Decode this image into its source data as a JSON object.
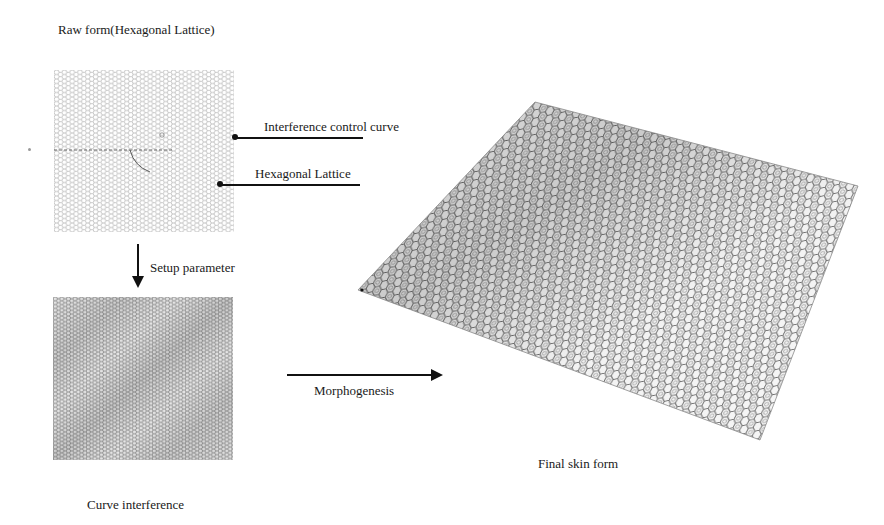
{
  "figure": {
    "raw_form": {
      "title": "Raw form(Hexagonal Lattice)",
      "callouts": [
        {
          "label": "Interference control curve"
        },
        {
          "label": "Hexagonal Lattice"
        }
      ]
    },
    "step_setup": {
      "label": "Setup parameter"
    },
    "curve_interference": {
      "caption": "Curve interference"
    },
    "step_morphogenesis": {
      "label": "Morphogenesis"
    },
    "final_skin": {
      "caption": "Final skin form"
    }
  },
  "colors": {
    "lattice_stroke_light": "#9a9a9a",
    "lattice_stroke_dense": "#8a8a8a",
    "arrow": "#111111",
    "skin_stroke": "#6e6e6e"
  }
}
